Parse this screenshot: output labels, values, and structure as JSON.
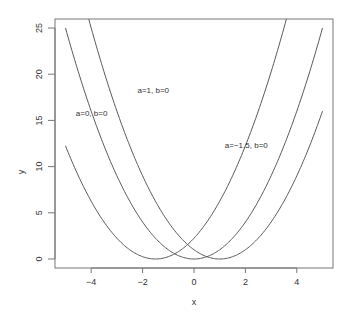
{
  "chart_data": {
    "type": "line",
    "title": "",
    "xlabel": "x",
    "ylabel": "y",
    "xlim": [
      -5.4,
      5.4
    ],
    "ylim": [
      -1,
      26
    ],
    "x_ticks": [
      -4,
      -2,
      0,
      2,
      4
    ],
    "x_tick_labels": [
      "−4",
      "−2",
      "0",
      "2",
      "4"
    ],
    "y_ticks": [
      0,
      5,
      10,
      15,
      20,
      25
    ],
    "y_tick_labels": [
      "0",
      "5",
      "10",
      "15",
      "20",
      "25"
    ],
    "grid": false,
    "legend": null,
    "x_range": [
      -5,
      5
    ],
    "series": [
      {
        "name": "a=0, b=0",
        "formula": "y = (x - 0)^2",
        "a": 0,
        "b": 0,
        "label_pos": [
          -4.6,
          15.5
        ]
      },
      {
        "name": "a=1, b=0",
        "formula": "y = (x - 1)^2",
        "a": 1,
        "b": 0,
        "label_pos": [
          -2.2,
          18
        ]
      },
      {
        "name": "a=−1.5, b=0",
        "formula": "y = (x + 1.5)^2",
        "a": -1.5,
        "b": 0,
        "label_pos": [
          1.2,
          12
        ]
      }
    ],
    "annotations": [
      "a=0, b=0",
      "a=1, b=0",
      "a=−1.5, b=0"
    ],
    "curve_color": "#5a5a5a",
    "frame_color": "#777777"
  }
}
